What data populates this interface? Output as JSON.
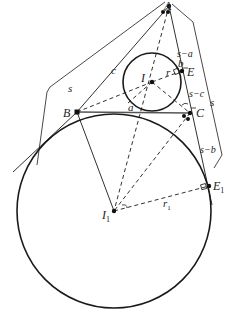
{
  "figure": {
    "type": "geometry",
    "colors": {
      "stroke": "#1a1a1a",
      "bg": "#ffffff"
    }
  },
  "labels": {
    "A": "A",
    "B": "B",
    "C": "C",
    "E": "E",
    "I": "I",
    "I1_main": "I",
    "I1_sub": "1",
    "E1_main": "E",
    "E1_sub": "1",
    "r": "r",
    "r1_main": "r",
    "r1_sub": "1",
    "a": "a",
    "b": "b",
    "c": "c",
    "s_left": "s",
    "s_right": "s",
    "s_minus_a": "s−a",
    "s_minus_b": "s−b",
    "s_minus_c": "s−c"
  }
}
